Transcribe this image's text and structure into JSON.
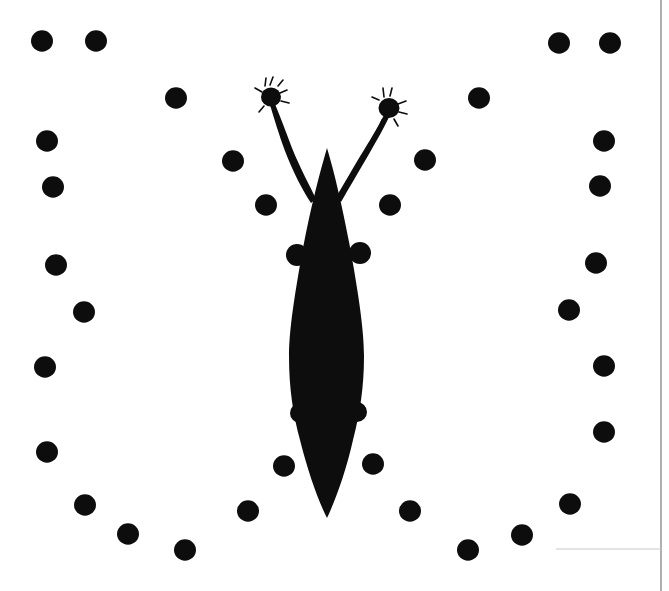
{
  "image": {
    "kind": "scanned-figure",
    "title": "Butterfly silhouette with surrounding dot ring",
    "width": 669,
    "height": 591,
    "background_color": "#ffffff",
    "ink_color": "#0d0d0d",
    "scan_edge_color": "#9a9a9a"
  },
  "specimen": {
    "name": "butterfly-silhouette",
    "label": "butterfly",
    "body": {
      "name": "elongated-lens-body",
      "center_x": 327,
      "top_y": 148,
      "bottom_y": 518,
      "max_half_width": 40,
      "widest_y": 330,
      "fill": "#0d0d0d"
    },
    "antennae": [
      {
        "name": "left-antenna",
        "base_x": 316,
        "base_y": 196,
        "tip_x": 272,
        "tip_y": 100,
        "club": {
          "cx": 271,
          "cy": 97,
          "rx": 11,
          "ry": 10
        }
      },
      {
        "name": "right-antenna",
        "base_x": 337,
        "base_y": 194,
        "tip_x": 388,
        "tip_y": 108,
        "club": {
          "cx": 389,
          "cy": 108,
          "rx": 11,
          "ry": 11
        }
      }
    ],
    "wing_stubs": [
      {
        "name": "forewing-stub-left",
        "cx": 297,
        "cy": 255,
        "r": 11
      },
      {
        "name": "forewing-stub-right",
        "cx": 360,
        "cy": 253,
        "r": 11
      },
      {
        "name": "hindwing-stub-left",
        "cx": 300,
        "cy": 413,
        "r": 10
      },
      {
        "name": "hindwing-stub-right",
        "cx": 357,
        "cy": 412,
        "r": 10
      }
    ]
  },
  "dot_ring": {
    "name": "dot-ring",
    "count": 34,
    "default_radius": 11,
    "fill": "#0d0d0d",
    "dots": [
      {
        "cx": 42,
        "cy": 41,
        "r": 11
      },
      {
        "cx": 96,
        "cy": 41,
        "r": 11
      },
      {
        "cx": 176,
        "cy": 98,
        "r": 11
      },
      {
        "cx": 479,
        "cy": 98,
        "r": 11
      },
      {
        "cx": 559,
        "cy": 43,
        "r": 11
      },
      {
        "cx": 610,
        "cy": 43,
        "r": 11
      },
      {
        "cx": 47,
        "cy": 141,
        "r": 11
      },
      {
        "cx": 604,
        "cy": 141,
        "r": 11
      },
      {
        "cx": 53,
        "cy": 187,
        "r": 11
      },
      {
        "cx": 600,
        "cy": 186,
        "r": 11
      },
      {
        "cx": 233,
        "cy": 161,
        "r": 11
      },
      {
        "cx": 425,
        "cy": 160,
        "r": 11
      },
      {
        "cx": 266,
        "cy": 205,
        "r": 11
      },
      {
        "cx": 390,
        "cy": 205,
        "r": 11
      },
      {
        "cx": 56,
        "cy": 265,
        "r": 11
      },
      {
        "cx": 596,
        "cy": 263,
        "r": 11
      },
      {
        "cx": 84,
        "cy": 312,
        "r": 11
      },
      {
        "cx": 569,
        "cy": 310,
        "r": 11
      },
      {
        "cx": 45,
        "cy": 367,
        "r": 11
      },
      {
        "cx": 604,
        "cy": 366,
        "r": 11
      },
      {
        "cx": 47,
        "cy": 452,
        "r": 11
      },
      {
        "cx": 604,
        "cy": 432,
        "r": 11
      },
      {
        "cx": 284,
        "cy": 466,
        "r": 11
      },
      {
        "cx": 373,
        "cy": 464,
        "r": 11
      },
      {
        "cx": 85,
        "cy": 505,
        "r": 11
      },
      {
        "cx": 570,
        "cy": 504,
        "r": 11
      },
      {
        "cx": 128,
        "cy": 534,
        "r": 11
      },
      {
        "cx": 522,
        "cy": 535,
        "r": 11
      },
      {
        "cx": 185,
        "cy": 550,
        "r": 11
      },
      {
        "cx": 468,
        "cy": 550,
        "r": 11
      },
      {
        "cx": 248,
        "cy": 511,
        "r": 11
      },
      {
        "cx": 410,
        "cy": 511,
        "r": 11
      },
      {
        "cx": 411,
        "cy": 552,
        "r": 0
      },
      {
        "cx": 249,
        "cy": 552,
        "r": 0
      }
    ]
  },
  "scan_edges": {
    "name": "scan-page-edges",
    "vertical_line": {
      "x": 661,
      "y1": 0,
      "y2": 591,
      "color": "#8f8f8f",
      "width": 1.4
    },
    "horizontal_line": {
      "x1": 556,
      "y1": 549,
      "x2": 661,
      "y2": 549,
      "color": "#c9c9c9",
      "width": 1
    }
  }
}
